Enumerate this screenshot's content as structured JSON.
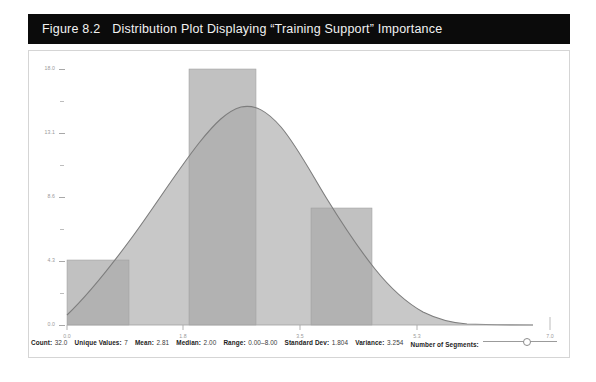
{
  "caption": {
    "number": "Figure 8.2",
    "text": "Distribution Plot Displaying “Training Support” Importance"
  },
  "chart_data": {
    "type": "area",
    "title": "Distribution Plot Displaying “Training Support” Importance",
    "xlabel": "",
    "ylabel": "",
    "grid": false,
    "legend": "none",
    "xlim": [
      0.0,
      7.0
    ],
    "ylim": [
      0.0,
      18.0
    ],
    "x_ticks": [
      "0.0",
      "1.8",
      "3.5",
      "5.3",
      "7.0"
    ],
    "x_tick_values": [
      0.0,
      1.8,
      3.5,
      5.3,
      7.0
    ],
    "y_ticks": [
      "0.0",
      "4.3",
      "8.6",
      "13.1",
      "18.0"
    ],
    "y_tick_values": [
      0.0,
      4.3,
      8.6,
      13.1,
      18.0
    ],
    "series": [
      {
        "name": "Histogram bars",
        "type": "bar",
        "color": "#a9a9a9",
        "bars": [
          {
            "x_start": 0.0,
            "x_end": 0.85,
            "value": 4.3
          },
          {
            "x_start": 1.68,
            "x_end": 2.6,
            "value": 17.6
          },
          {
            "x_start": 3.38,
            "x_end": 4.22,
            "value": 8.0
          }
        ]
      },
      {
        "name": "Density curve",
        "type": "line",
        "color": "#7d7d7d",
        "fill": "#c8c8c8",
        "x": [
          0.0,
          0.35,
          0.7,
          1.05,
          1.4,
          1.75,
          2.1,
          2.45,
          2.8,
          3.15,
          3.5,
          3.85,
          4.2,
          4.55,
          4.9,
          5.25,
          5.6,
          5.95,
          6.3,
          6.65,
          7.0
        ],
        "y": [
          0.0,
          3.0,
          6.2,
          9.4,
          12.6,
          15.6,
          17.7,
          18.0,
          16.6,
          14.2,
          11.6,
          9.2,
          7.1,
          5.4,
          4.0,
          2.8,
          1.8,
          1.0,
          0.4,
          0.25,
          0.2
        ]
      }
    ]
  },
  "stats": [
    {
      "label": "Count:",
      "value": "32.0"
    },
    {
      "label": "Unique Values:",
      "value": "7"
    },
    {
      "label": "Mean:",
      "value": "2.81"
    },
    {
      "label": "Median:",
      "value": "2.00"
    },
    {
      "label": "Range:",
      "value": "0.00–8.00"
    },
    {
      "label": "Standard Dev:",
      "value": "1.804"
    },
    {
      "label": "Variance:",
      "value": "3.254"
    }
  ],
  "segments_control": {
    "label": "Number of Segments:",
    "knob_position_pct": 60
  },
  "colors": {
    "caption_bg": "#0b0b0b",
    "caption_text": "#f2f2f2",
    "panel_bg": "#ffffff",
    "panel_border": "#d5d5d5",
    "curve_fill": "#c8c8c8",
    "curve_line": "#7d7d7d",
    "bar_fill": "#a9a9a9",
    "axis": "#a8a8a8",
    "tick_text": "#9a9a9a"
  }
}
